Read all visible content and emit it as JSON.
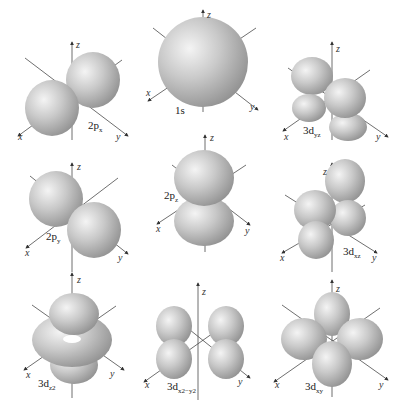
{
  "axes": {
    "x": "x",
    "y": "y",
    "z": "z"
  },
  "panels": [
    {
      "id": "2px",
      "label_main": "2p",
      "label_sub": "x",
      "row": 1,
      "col": 1
    },
    {
      "id": "1s",
      "label_main": "1s",
      "label_sub": "",
      "row": 1,
      "col": 2
    },
    {
      "id": "3dyz",
      "label_main": "3d",
      "label_sub": "yz",
      "row": 1,
      "col": 3
    },
    {
      "id": "2py",
      "label_main": "2p",
      "label_sub": "y",
      "row": 2,
      "col": 1
    },
    {
      "id": "2pz",
      "label_main": "2p",
      "label_sub": "z",
      "row": 2,
      "col": 2
    },
    {
      "id": "3dxz",
      "label_main": "3d",
      "label_sub": "xz",
      "row": 2,
      "col": 3
    },
    {
      "id": "3dz2",
      "label_main": "3d",
      "label_sub": "z2",
      "row": 3,
      "col": 1
    },
    {
      "id": "3dx2y2",
      "label_main": "3d",
      "label_sub": "x2−y2",
      "row": 3,
      "col": 2
    },
    {
      "id": "3dxy",
      "label_main": "3d",
      "label_sub": "xy",
      "row": 3,
      "col": 3
    }
  ],
  "colors": {
    "lobe_light": "#f2f2f2",
    "lobe_mid": "#bdbdbd",
    "lobe_dark": "#8a8a8a",
    "axis": "#4a4a4a"
  }
}
